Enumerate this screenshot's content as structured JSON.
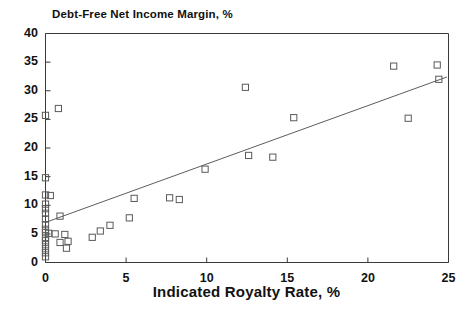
{
  "chart_data": {
    "type": "scatter",
    "title": "Debt-Free Net Income Margin, %",
    "xlabel": "Indicated Royalty Rate, %",
    "ylabel": "Debt-Free Net Income Margin, %",
    "xlim": [
      0,
      25
    ],
    "ylim": [
      0,
      40
    ],
    "xticks": [
      0,
      5,
      10,
      15,
      20,
      25
    ],
    "yticks": [
      0,
      5,
      10,
      15,
      20,
      25,
      30,
      35,
      40
    ],
    "xtick_labels": [
      "0",
      "5",
      "10",
      "15",
      "20",
      "25"
    ],
    "ytick_labels": [
      "0",
      "5",
      "10",
      "15",
      "20",
      "25",
      "30",
      "35",
      "40"
    ],
    "grid": false,
    "legend": false,
    "marker": "open-square",
    "points": [
      {
        "x": 0.0,
        "y": 25.7
      },
      {
        "x": 0.8,
        "y": 26.9
      },
      {
        "x": 0.0,
        "y": 14.8
      },
      {
        "x": 0.0,
        "y": 11.8
      },
      {
        "x": 0.3,
        "y": 11.7
      },
      {
        "x": 0.0,
        "y": 10.2
      },
      {
        "x": 0.0,
        "y": 9.4
      },
      {
        "x": 0.0,
        "y": 8.6
      },
      {
        "x": 0.9,
        "y": 8.1
      },
      {
        "x": 0.0,
        "y": 7.6
      },
      {
        "x": 0.0,
        "y": 6.6
      },
      {
        "x": 0.0,
        "y": 5.8
      },
      {
        "x": 0.0,
        "y": 5.2
      },
      {
        "x": 0.2,
        "y": 5.1
      },
      {
        "x": 0.6,
        "y": 5.0
      },
      {
        "x": 1.2,
        "y": 4.9
      },
      {
        "x": 0.0,
        "y": 4.4
      },
      {
        "x": 0.0,
        "y": 3.8
      },
      {
        "x": 0.9,
        "y": 3.5
      },
      {
        "x": 1.4,
        "y": 3.7
      },
      {
        "x": 0.0,
        "y": 3.1
      },
      {
        "x": 0.0,
        "y": 2.4
      },
      {
        "x": 1.3,
        "y": 2.5
      },
      {
        "x": 0.0,
        "y": 1.7
      },
      {
        "x": 0.0,
        "y": 1.0
      },
      {
        "x": 2.9,
        "y": 4.4
      },
      {
        "x": 3.4,
        "y": 5.5
      },
      {
        "x": 4.0,
        "y": 6.5
      },
      {
        "x": 5.2,
        "y": 7.8
      },
      {
        "x": 5.5,
        "y": 11.2
      },
      {
        "x": 7.7,
        "y": 11.3
      },
      {
        "x": 8.3,
        "y": 11.0
      },
      {
        "x": 9.9,
        "y": 16.3
      },
      {
        "x": 12.4,
        "y": 30.6
      },
      {
        "x": 12.6,
        "y": 18.7
      },
      {
        "x": 14.1,
        "y": 18.4
      },
      {
        "x": 15.4,
        "y": 25.3
      },
      {
        "x": 21.6,
        "y": 34.3
      },
      {
        "x": 22.5,
        "y": 25.2
      },
      {
        "x": 24.3,
        "y": 34.5
      },
      {
        "x": 24.4,
        "y": 32.0
      }
    ],
    "trendline": {
      "x0": 0.0,
      "y0": 7.0,
      "x1": 24.9,
      "y1": 32.4
    }
  }
}
